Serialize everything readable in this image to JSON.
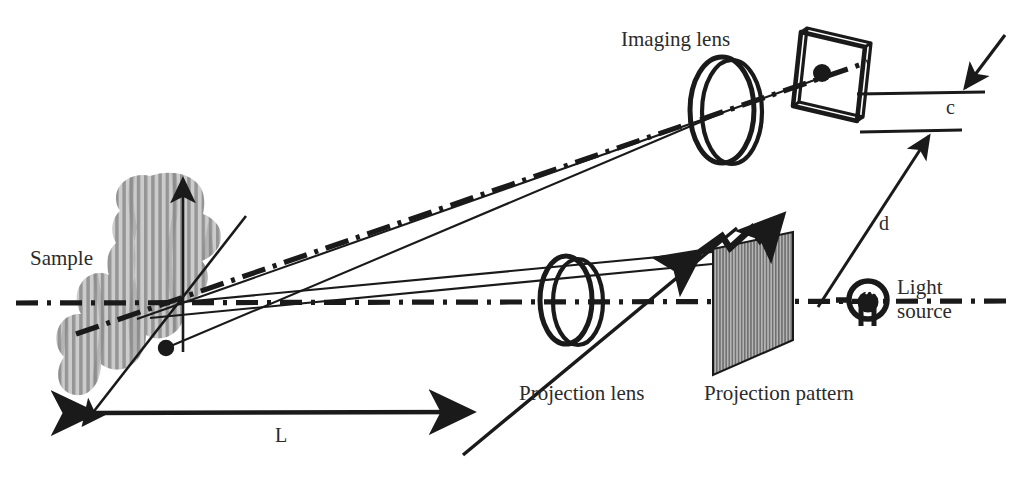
{
  "figure": {
    "type": "optical-setup-diagram",
    "background_color": "#ffffff",
    "ink_color": "#1a1a1a",
    "text_color": "#2b2b2b",
    "sample_fill": "#a8a8a8",
    "pattern_fill": "#9d9d9d"
  },
  "labels": {
    "sample": "Sample",
    "imaging_lens": "Imaging lens",
    "projection_lens": "Projection lens",
    "projection_pattern": "Projection pattern",
    "light_source_line1": "Light",
    "light_source_line2": "source",
    "dim_L": "L",
    "dim_d": "d",
    "dim_c": "c"
  },
  "components": [
    {
      "name": "sample",
      "label": "Sample",
      "kind": "fringed-object"
    },
    {
      "name": "imaging-lens",
      "label": "Imaging lens",
      "kind": "lens"
    },
    {
      "name": "detector-frame",
      "label": "",
      "kind": "image-plane"
    },
    {
      "name": "projection-lens",
      "label": "Projection lens",
      "kind": "lens"
    },
    {
      "name": "projection-pattern",
      "label": "Projection pattern",
      "kind": "grating"
    },
    {
      "name": "light-source",
      "label": "Light source",
      "kind": "lamp"
    }
  ],
  "dimensions": [
    {
      "name": "L",
      "symbol": "L",
      "between": "sample to projection lens axis"
    },
    {
      "name": "d",
      "symbol": "d",
      "between": "light source to imaging axis"
    },
    {
      "name": "c",
      "symbol": "c",
      "between": "imaging axis lines"
    }
  ],
  "icons": {
    "up_axis": "axis-arrow-icon",
    "zigzag": "zigzag-arrow-icon",
    "lamp": "lamp-icon"
  }
}
